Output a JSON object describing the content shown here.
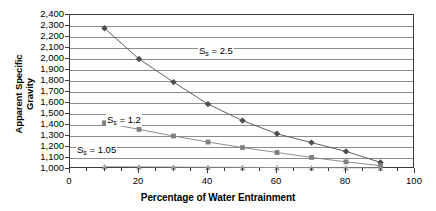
{
  "chart_data": {
    "type": "line",
    "title": "",
    "xlabel": "Percentage of Water Entrainment",
    "ylabel_line1": "Apparent Specific",
    "ylabel_line2": "Gravity",
    "xlim": [
      0,
      100
    ],
    "ylim": [
      1000,
      2400
    ],
    "xticks": [
      0,
      20,
      40,
      60,
      80,
      100
    ],
    "xtick_labels": [
      "0",
      "20",
      "40",
      "60",
      "80",
      "100"
    ],
    "xtick_minor_step": 5,
    "yticks": [
      1000,
      1100,
      1200,
      1300,
      1400,
      1500,
      1600,
      1700,
      1800,
      1900,
      2000,
      2100,
      2200,
      2300,
      2400
    ],
    "ytick_labels": [
      "1,000",
      "1,100",
      "1,200",
      "1,300",
      "1,400",
      "1,500",
      "1,600",
      "1,700",
      "1,800",
      "1,900",
      "2,000",
      "2,100",
      "2,200",
      "2,300",
      "2,400"
    ],
    "grid": true,
    "grid_axis": "y",
    "legend_position": "inline-annotation",
    "x": [
      10,
      20,
      30,
      40,
      50,
      60,
      70,
      80,
      90
    ],
    "series": [
      {
        "name": "Ss = 2.5",
        "label_text": "S",
        "label_sub": "s",
        "label_value": " = 2.5",
        "marker": "diamond",
        "color": "#4d4d4d",
        "values": [
          2280,
          2000,
          1790,
          1590,
          1440,
          1320,
          1240,
          1160,
          1060
        ]
      },
      {
        "name": "Ss = 1.2",
        "label_text": "S",
        "label_sub": "s",
        "label_value": " = 1.2",
        "marker": "square",
        "color": "#808080",
        "values": [
          1420,
          1360,
          1300,
          1245,
          1195,
          1150,
          1105,
          1065,
          1030
        ]
      },
      {
        "name": "Ss = 1.05",
        "label_text": "S",
        "label_sub": "s",
        "label_value": " = 1.05",
        "marker": "triangle",
        "color": "#9a9a9a",
        "values": [
          1022,
          1020,
          1018,
          1016,
          1015,
          1013,
          1012,
          1011,
          1010
        ]
      }
    ],
    "annotations": [
      {
        "name": "ss-25-label",
        "series": 0,
        "x_px": 128,
        "y_px": 30
      },
      {
        "name": "ss-12-label",
        "series": 1,
        "x_px": 36,
        "y_px": 99
      },
      {
        "name": "ss-105-label",
        "series": 2,
        "x_px": 6,
        "y_px": 129
      }
    ]
  }
}
